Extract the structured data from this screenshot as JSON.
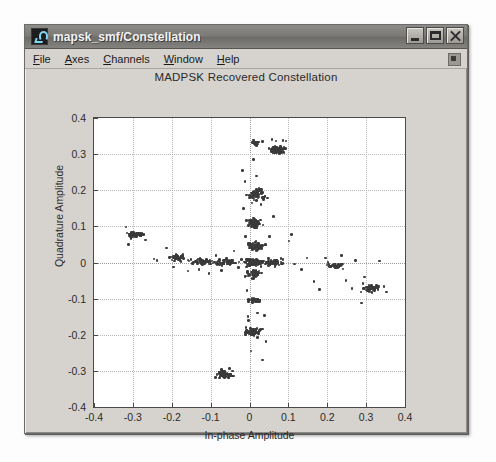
{
  "window": {
    "title": "mapsk_smf/Constellation",
    "icon": "scope-icon",
    "buttons": {
      "minimize": "minimize-button",
      "maximize": "maximize-button",
      "close": "close-button"
    }
  },
  "menu": {
    "items": [
      {
        "label": "File",
        "mnemonic": "F"
      },
      {
        "label": "Axes",
        "mnemonic": "A"
      },
      {
        "label": "Channels",
        "mnemonic": "C"
      },
      {
        "label": "Window",
        "mnemonic": "W"
      },
      {
        "label": "Help",
        "mnemonic": "H"
      }
    ],
    "corner_icon": "toolbar-toggle-icon"
  },
  "chart_data": {
    "type": "scatter",
    "title": "MADPSK Recovered Constellation",
    "xlabel": "In-phase Amplitude",
    "ylabel": "Quadrature Amplitude",
    "xlim": [
      -0.4,
      0.4
    ],
    "ylim": [
      -0.4,
      0.4
    ],
    "xticks": [
      -0.4,
      -0.3,
      -0.2,
      -0.1,
      0,
      0.1,
      0.2,
      0.3,
      0.4
    ],
    "yticks": [
      -0.4,
      -0.3,
      -0.2,
      -0.1,
      0,
      0.1,
      0.2,
      0.3,
      0.4
    ],
    "xticklabels": [
      "-0.4",
      "-0.3",
      "-0.2",
      "-0.1",
      "0",
      "0.1",
      "0.2",
      "0.3",
      "0.4"
    ],
    "yticklabels": [
      "-0.4",
      "-0.3",
      "-0.2",
      "-0.1",
      "0",
      "0.1",
      "0.2",
      "0.3",
      "0.4"
    ],
    "grid": true,
    "legend": null,
    "marker": {
      "shape": "circle",
      "color": "#3a3a3a",
      "size": 2.6
    },
    "clusters": [
      {
        "name": "upper-right-ring",
        "cx": 0.072,
        "cy": 0.312,
        "sx": 0.016,
        "sy": 0.009,
        "n": 78
      },
      {
        "name": "upper-left-arc",
        "cx": 0.018,
        "cy": 0.33,
        "sx": 0.012,
        "sy": 0.007,
        "n": 16
      },
      {
        "name": "q-0.19",
        "cx": 0.016,
        "cy": 0.19,
        "sx": 0.018,
        "sy": 0.011,
        "n": 62
      },
      {
        "name": "q-0.11",
        "cx": 0.014,
        "cy": 0.11,
        "sx": 0.017,
        "sy": 0.01,
        "n": 52
      },
      {
        "name": "q-0.045",
        "cx": 0.016,
        "cy": 0.045,
        "sx": 0.019,
        "sy": 0.009,
        "n": 58
      },
      {
        "name": "i-neg-0.29",
        "cx": -0.292,
        "cy": 0.077,
        "sx": 0.021,
        "sy": 0.008,
        "n": 60
      },
      {
        "name": "i-neg-0.19",
        "cx": -0.185,
        "cy": 0.013,
        "sx": 0.02,
        "sy": 0.007,
        "n": 46
      },
      {
        "name": "i-neg-0.12",
        "cx": -0.122,
        "cy": 0.002,
        "sx": 0.022,
        "sy": 0.007,
        "n": 52
      },
      {
        "name": "i-neg-0.06",
        "cx": -0.058,
        "cy": 0.0,
        "sx": 0.022,
        "sy": 0.008,
        "n": 54
      },
      {
        "name": "origin-band",
        "cx": 0.01,
        "cy": 0.0,
        "sx": 0.023,
        "sy": 0.009,
        "n": 72
      },
      {
        "name": "i-pos-0.07",
        "cx": 0.068,
        "cy": 0.0,
        "sx": 0.022,
        "sy": 0.008,
        "n": 44
      },
      {
        "name": "q-neg-0.03",
        "cx": 0.012,
        "cy": -0.032,
        "sx": 0.016,
        "sy": 0.009,
        "n": 46
      },
      {
        "name": "q-neg-0.105",
        "cx": 0.013,
        "cy": -0.105,
        "sx": 0.015,
        "sy": 0.006,
        "n": 34
      },
      {
        "name": "q-neg-0.19",
        "cx": 0.008,
        "cy": -0.192,
        "sx": 0.018,
        "sy": 0.011,
        "n": 60
      },
      {
        "name": "lower-left-ring",
        "cx": -0.062,
        "cy": -0.31,
        "sx": 0.017,
        "sy": 0.01,
        "n": 58
      },
      {
        "name": "i-pos-0.30",
        "cx": 0.312,
        "cy": -0.072,
        "sx": 0.019,
        "sy": 0.009,
        "n": 56
      },
      {
        "name": "i-pos-0.22",
        "cx": 0.222,
        "cy": -0.01,
        "sx": 0.017,
        "sy": 0.008,
        "n": 34
      }
    ],
    "outliers": [
      [
        -0.318,
        0.098
      ],
      [
        -0.312,
        0.05
      ],
      [
        -0.268,
        0.062
      ],
      [
        -0.246,
        0.01
      ],
      [
        -0.238,
        0.006
      ],
      [
        -0.214,
        0.04
      ],
      [
        -0.196,
        -0.012
      ],
      [
        -0.158,
        -0.024
      ],
      [
        -0.13,
        -0.02
      ],
      [
        -0.104,
        -0.03
      ],
      [
        -0.086,
        0.02
      ],
      [
        -0.072,
        -0.022
      ],
      [
        -0.04,
        0.032
      ],
      [
        -0.028,
        -0.014
      ],
      [
        -0.018,
        0.255
      ],
      [
        -0.016,
        0.15
      ],
      [
        -0.012,
        0.225
      ],
      [
        -0.01,
        0.072
      ],
      [
        -0.006,
        -0.078
      ],
      [
        -0.004,
        -0.15
      ],
      [
        -0.002,
        -0.16
      ],
      [
        0.004,
        -0.245
      ],
      [
        0.006,
        0.165
      ],
      [
        0.01,
        0.285
      ],
      [
        0.018,
        0.24
      ],
      [
        0.02,
        -0.14
      ],
      [
        0.024,
        0.205
      ],
      [
        0.03,
        0.16
      ],
      [
        0.034,
        -0.27
      ],
      [
        0.038,
        -0.146
      ],
      [
        0.046,
        0.178
      ],
      [
        0.052,
        0.072
      ],
      [
        0.058,
        0.34
      ],
      [
        0.062,
        0.128
      ],
      [
        0.068,
        0.336
      ],
      [
        0.086,
        0.338
      ],
      [
        0.094,
        0.336
      ],
      [
        0.102,
        0.06
      ],
      [
        0.108,
        0.078
      ],
      [
        0.116,
        -0.004
      ],
      [
        0.134,
        -0.02
      ],
      [
        0.148,
        0.012
      ],
      [
        0.166,
        -0.052
      ],
      [
        0.18,
        -0.074
      ],
      [
        0.196,
        0.012
      ],
      [
        0.236,
        0.02
      ],
      [
        0.248,
        -0.05
      ],
      [
        0.264,
        -0.072
      ],
      [
        0.272,
        0.006
      ],
      [
        0.288,
        -0.112
      ],
      [
        0.296,
        -0.04
      ],
      [
        0.334,
        0.004
      ],
      [
        0.346,
        -0.066
      ],
      [
        0.352,
        -0.082
      ],
      [
        -0.176,
        0.002
      ],
      [
        0.042,
        -0.218
      ]
    ]
  }
}
